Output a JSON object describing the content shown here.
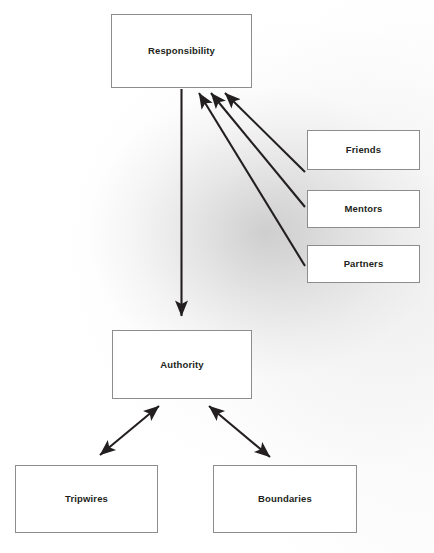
{
  "diagram": {
    "background_color": "#ffffff",
    "line_color": "#231f20",
    "box_border_color": "#8d8d8d",
    "text_color": "#231f20",
    "nodes": [
      {
        "id": "responsibility",
        "label": "Responsibility"
      },
      {
        "id": "authority",
        "label": "Authority"
      },
      {
        "id": "friends",
        "label": "Friends"
      },
      {
        "id": "mentors",
        "label": "Mentors"
      },
      {
        "id": "partners",
        "label": "Partners"
      },
      {
        "id": "tripwires",
        "label": "Tripwires"
      },
      {
        "id": "boundaries",
        "label": "Boundaries"
      }
    ],
    "edges": [
      {
        "id": "responsibility-to-authority",
        "from": "responsibility",
        "to": "authority",
        "direction": "single",
        "style": "straight-vertical"
      },
      {
        "id": "friends-to-responsibility",
        "from": "friends",
        "to": "responsibility",
        "direction": "single",
        "style": "diagonal"
      },
      {
        "id": "mentors-to-responsibility",
        "from": "mentors",
        "to": "responsibility",
        "direction": "single",
        "style": "diagonal"
      },
      {
        "id": "partners-to-responsibility",
        "from": "partners",
        "to": "responsibility",
        "direction": "single",
        "style": "diagonal"
      },
      {
        "id": "authority-tripwires",
        "from": "authority",
        "to": "tripwires",
        "direction": "double",
        "style": "diagonal"
      },
      {
        "id": "authority-boundaries",
        "from": "authority",
        "to": "boundaries",
        "direction": "double",
        "style": "diagonal"
      }
    ]
  }
}
